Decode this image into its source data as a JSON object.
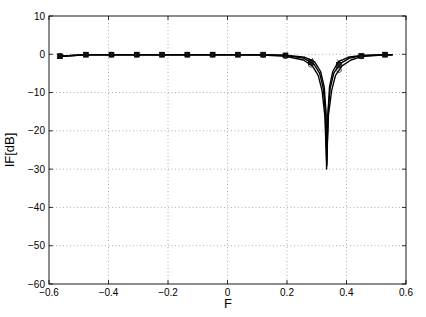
{
  "chart_data": {
    "type": "line",
    "title": "",
    "xlabel": "F",
    "ylabel": "IF[dB]",
    "xlim": [
      -0.6,
      0.6
    ],
    "ylim": [
      -60,
      10
    ],
    "grid": true,
    "legend": null,
    "xticks": [
      -0.6,
      -0.4,
      -0.2,
      0,
      0.2,
      0.4,
      0.6
    ],
    "xtick_labels": [
      "−0.6",
      "−0.4",
      "−0.2",
      "0",
      "0.2",
      "0.4",
      "0.6"
    ],
    "yticks": [
      10,
      0,
      -10,
      -20,
      -30,
      -40,
      -50,
      -60
    ],
    "ytick_labels": [
      "10",
      "0",
      "−10",
      "−20",
      "−30",
      "−40",
      "−50",
      "−60"
    ],
    "notch_frequency": 0.333,
    "notch_depth_db": -30,
    "series": [
      {
        "name": "curve-1",
        "marker": "square",
        "x": [
          -0.563,
          -0.476,
          -0.39,
          -0.305,
          -0.22,
          -0.135,
          -0.05,
          0.035,
          0.12,
          0.195,
          0.255,
          0.29,
          0.31,
          0.322,
          0.33,
          0.333,
          0.337,
          0.345,
          0.357,
          0.377,
          0.41,
          0.45,
          0.53,
          0.555
        ],
        "values": [
          -0.5,
          -0.1,
          -0.1,
          -0.1,
          -0.1,
          -0.1,
          -0.1,
          -0.1,
          -0.1,
          -0.3,
          -1.0,
          -2.5,
          -5.0,
          -9.0,
          -16.0,
          -30.0,
          -16.0,
          -9.0,
          -5.0,
          -2.5,
          -1.0,
          -0.4,
          -0.1,
          -0.1
        ]
      },
      {
        "name": "curve-2",
        "marker": "circle",
        "x": [
          -0.563,
          -0.476,
          -0.39,
          -0.305,
          -0.22,
          -0.135,
          -0.05,
          0.035,
          0.12,
          0.195,
          0.255,
          0.285,
          0.305,
          0.318,
          0.327,
          0.333,
          0.339,
          0.35,
          0.363,
          0.385,
          0.415,
          0.45,
          0.53,
          0.555
        ],
        "values": [
          -0.5,
          -0.1,
          -0.1,
          -0.1,
          -0.1,
          -0.1,
          -0.1,
          -0.1,
          -0.2,
          -0.5,
          -1.5,
          -3.0,
          -5.5,
          -9.5,
          -16.0,
          -28.0,
          -16.0,
          -9.5,
          -5.5,
          -3.0,
          -1.5,
          -0.6,
          -0.1,
          -0.1
        ]
      },
      {
        "name": "curve-3",
        "marker": "cross",
        "x": [
          -0.563,
          -0.476,
          -0.39,
          -0.305,
          -0.22,
          -0.135,
          -0.05,
          0.035,
          0.12,
          0.195,
          0.26,
          0.293,
          0.313,
          0.325,
          0.331,
          0.334,
          0.338,
          0.343,
          0.354,
          0.372,
          0.405,
          0.45,
          0.53,
          0.555
        ],
        "values": [
          -0.5,
          -0.1,
          -0.1,
          -0.1,
          -0.1,
          -0.1,
          -0.1,
          -0.1,
          -0.1,
          -0.2,
          -0.8,
          -2.0,
          -4.5,
          -8.5,
          -15.0,
          -29.0,
          -15.0,
          -8.5,
          -4.5,
          -2.0,
          -0.8,
          -0.3,
          -0.1,
          -0.1
        ]
      }
    ],
    "marker_positions_x": [
      -0.563,
      -0.476,
      -0.39,
      -0.305,
      -0.22,
      -0.135,
      -0.05,
      0.035,
      0.12,
      0.195,
      0.28,
      0.375,
      0.45,
      0.53
    ]
  }
}
